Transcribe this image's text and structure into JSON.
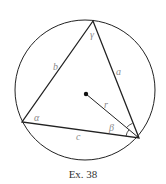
{
  "figure": {
    "caption": "Ex. 38",
    "labels": {
      "alpha": "α",
      "beta": "β",
      "gamma": "γ",
      "side_a": "a",
      "side_b": "b",
      "side_c": "c",
      "radius": "r"
    },
    "colors": {
      "stroke": "#222222",
      "label": "#8a8a8a"
    }
  }
}
